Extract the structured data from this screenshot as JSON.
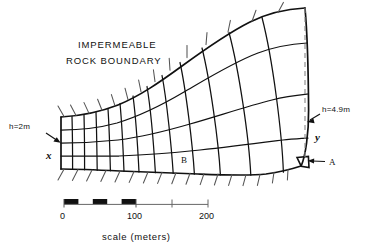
{
  "figure": {
    "type": "finite-element-flow-net-diagram",
    "boundary_label_line1": "IMPERMEABLE",
    "boundary_label_line2": "ROCK  BOUNDARY",
    "head_left": "h=2m",
    "head_right": "h=4.9m",
    "axis_x": "x",
    "axis_y": "y",
    "point_a": "A",
    "point_b": "B"
  },
  "scale": {
    "caption": "scale  (meters)",
    "ticks": [
      "0",
      "100",
      "200"
    ],
    "tick_values": [
      0,
      50,
      100,
      150,
      200
    ],
    "filled_segments": [
      [
        0,
        15
      ],
      [
        30,
        45
      ],
      [
        60,
        75
      ]
    ],
    "bar_end": 200
  },
  "colors": {
    "ink": "#111111",
    "background": "#ffffff",
    "dashed": "#777777"
  },
  "mesh": {
    "columns": 13,
    "rows": 4,
    "hatch_top_count": 13,
    "hatch_bottom_count": 13,
    "description": "Curvilinear quadrilateral finite element mesh flaring from a narrow rectangular left end to a wide curved right end"
  }
}
